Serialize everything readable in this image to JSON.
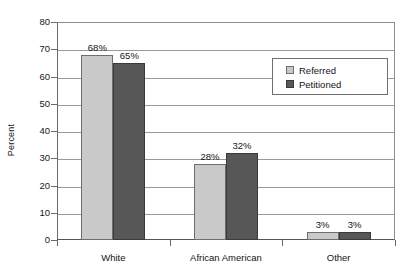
{
  "chart_data": {
    "type": "bar",
    "title": "",
    "xlabel": "",
    "ylabel": "Percent",
    "categories": [
      "White",
      "African American",
      "Other"
    ],
    "series": [
      {
        "name": "Referred",
        "values": [
          68,
          65,
          3
        ],
        "color": "#c9c9c9"
      },
      {
        "name": "Petitioned",
        "values": [
          65,
          32,
          3
        ],
        "color": "#575757"
      }
    ],
    "value_labels": {
      "Referred": [
        "68%",
        "28%",
        "3%"
      ],
      "Petitioned": [
        "65%",
        "32%",
        "3%"
      ]
    },
    "plotted_values": {
      "Referred": [
        68,
        28,
        3
      ],
      "Petitioned": [
        65,
        32,
        3
      ]
    },
    "ylim": [
      0,
      80
    ],
    "yticks": [
      0,
      10,
      20,
      30,
      40,
      50,
      60,
      70,
      80
    ],
    "ytick_labels": [
      "0",
      "10",
      "20",
      "30",
      "40",
      "50",
      "60",
      "70",
      "80"
    ],
    "grid": true,
    "legend_position": "upper right"
  },
  "axis": {
    "y_title": "Percent"
  },
  "legend": {
    "entries": [
      {
        "label": "Referred"
      },
      {
        "label": "Petitioned"
      }
    ]
  }
}
